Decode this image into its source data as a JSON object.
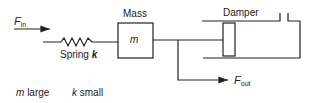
{
  "diagram": {
    "input_force": {
      "symbol": "F",
      "subscript": "in"
    },
    "spring": {
      "label": "Spring",
      "symbol": "k"
    },
    "mass": {
      "label": "Mass",
      "symbol": "m"
    },
    "damper": {
      "label": "Damper"
    },
    "output_force": {
      "symbol": "F",
      "subscript": "out"
    },
    "notes": [
      {
        "symbol": "m",
        "text": "large"
      },
      {
        "symbol": "k",
        "text": "small"
      }
    ]
  },
  "colors": {
    "stroke": "#222222",
    "background": "#ffffff"
  }
}
